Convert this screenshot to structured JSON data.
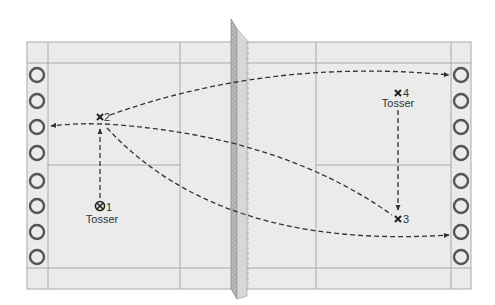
{
  "diagram": {
    "colors": {
      "court_fill": "#ebebeb",
      "court_line": "#a8a8a8",
      "net": "#9a9a9a",
      "path": "#333333",
      "target_ring": "#555555"
    },
    "players": [
      {
        "id": "1",
        "number": "1",
        "marker": "circle-x",
        "role": "Tosser",
        "x": 100,
        "y": 207
      },
      {
        "id": "2",
        "number": "2",
        "marker": "x",
        "role": "",
        "x": 100,
        "y": 117
      },
      {
        "id": "3",
        "number": "3",
        "marker": "x",
        "role": "",
        "x": 398,
        "y": 219
      },
      {
        "id": "4",
        "number": "4",
        "marker": "x",
        "role": "Tosser",
        "x": 398,
        "y": 93
      }
    ],
    "paths": [
      {
        "from": "1",
        "to": "2",
        "style": "dashed"
      },
      {
        "from": "2",
        "to": "left-target-3",
        "style": "dashed"
      },
      {
        "from": "2",
        "to": "right-target-1",
        "style": "dashed"
      },
      {
        "from": "2",
        "to": "3",
        "style": "dashed"
      },
      {
        "from": "2",
        "to": "right-target-7",
        "style": "dashed"
      },
      {
        "from": "4",
        "to": "3",
        "style": "dashed"
      }
    ],
    "targets": {
      "left_count": 8,
      "right_count": 8
    }
  }
}
